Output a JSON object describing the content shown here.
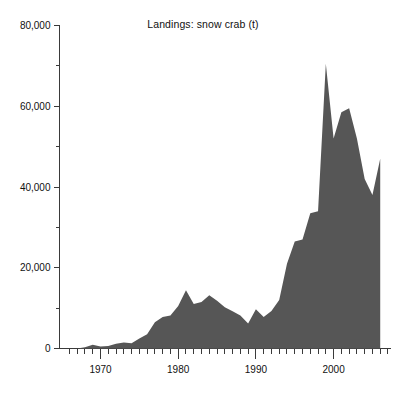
{
  "chart_data": {
    "type": "area",
    "title": "Landings: snow crab (t)",
    "xlabel": "",
    "ylabel": "",
    "xlim": [
      1966,
      2007
    ],
    "ylim": [
      0,
      80000
    ],
    "grid": false,
    "legend": "none",
    "series_color": "#565656",
    "axis_color": "#3a3a3a",
    "y_ticks_major": [
      0,
      20000,
      40000,
      60000,
      80000
    ],
    "y_tick_labels": [
      "0",
      "20,000",
      "40,000",
      "60,000",
      "80,000"
    ],
    "y_ticks_minor": [
      10000,
      30000,
      50000,
      70000
    ],
    "x_ticks_major": [
      1970,
      1980,
      1990,
      2000
    ],
    "x_tick_labels": [
      "1970",
      "1980",
      "1990",
      "2000"
    ],
    "x_tick_minor_step": 1,
    "x": [
      1966,
      1967,
      1968,
      1969,
      1970,
      1971,
      1972,
      1973,
      1974,
      1975,
      1976,
      1977,
      1978,
      1979,
      1980,
      1981,
      1982,
      1983,
      1984,
      1985,
      1986,
      1987,
      1988,
      1989,
      1990,
      1991,
      1992,
      1993,
      1994,
      1995,
      1996,
      1997,
      1998,
      1999,
      2000,
      2001,
      2002,
      2003,
      2004,
      2005,
      2006
    ],
    "values": [
      0,
      0,
      300,
      900,
      500,
      600,
      1200,
      1500,
      1300,
      2500,
      3500,
      6500,
      7800,
      8200,
      10500,
      14400,
      11000,
      11500,
      13200,
      11800,
      10200,
      9200,
      8200,
      6200,
      9700,
      7800,
      9300,
      12000,
      21000,
      26500,
      27000,
      33500,
      34000,
      70500,
      52000,
      58500,
      59500,
      52000,
      42000,
      38000,
      47000
    ],
    "units": "t",
    "annotations": []
  }
}
